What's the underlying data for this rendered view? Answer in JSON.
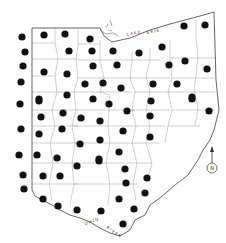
{
  "map": {
    "region": "Ohio",
    "description": "County outline map of Ohio with a dot marking each sampled county",
    "labels": {
      "lake": "LAKE ERIE",
      "lake_part1": "LAKE",
      "lake_part2": "ERIE",
      "river": "OHIO RIVER",
      "river_part1": "OHIO",
      "river_part2": "RIVER",
      "north": "N"
    },
    "colors": {
      "background": "#ffffff",
      "border": "#555555",
      "county_line": "#9a9a9a",
      "dot": "#111111"
    },
    "dots": [
      [
        22,
        37
      ],
      [
        44,
        35
      ],
      [
        65,
        34
      ],
      [
        90,
        39
      ],
      [
        184,
        26
      ],
      [
        205,
        25
      ],
      [
        25,
        52
      ],
      [
        69,
        51
      ],
      [
        92,
        51
      ],
      [
        113,
        51
      ],
      [
        139,
        53
      ],
      [
        162,
        47
      ],
      [
        23,
        66
      ],
      [
        44,
        72
      ],
      [
        67,
        74
      ],
      [
        93,
        66
      ],
      [
        117,
        65
      ],
      [
        169,
        65
      ],
      [
        185,
        61
      ],
      [
        207,
        69
      ],
      [
        21,
        82
      ],
      [
        85,
        84
      ],
      [
        103,
        83
      ],
      [
        121,
        88
      ],
      [
        153,
        84
      ],
      [
        177,
        84
      ],
      [
        67,
        95
      ],
      [
        39,
        99
      ],
      [
        93,
        99
      ],
      [
        192,
        97
      ],
      [
        20,
        104
      ],
      [
        39,
        101
      ],
      [
        109,
        104
      ],
      [
        151,
        101
      ],
      [
        192,
        99
      ],
      [
        41,
        117
      ],
      [
        63,
        113
      ],
      [
        81,
        118
      ],
      [
        100,
        121
      ],
      [
        127,
        111
      ],
      [
        150,
        116
      ],
      [
        209,
        111
      ],
      [
        21,
        129
      ],
      [
        39,
        134
      ],
      [
        62,
        129
      ],
      [
        123,
        131
      ],
      [
        100,
        140
      ],
      [
        80,
        144
      ],
      [
        150,
        137
      ],
      [
        19,
        155
      ],
      [
        37,
        155
      ],
      [
        57,
        158
      ],
      [
        119,
        152
      ],
      [
        99,
        159
      ],
      [
        77,
        166
      ],
      [
        99,
        161
      ],
      [
        125,
        169
      ],
      [
        23,
        175
      ],
      [
        43,
        176
      ],
      [
        60,
        176
      ],
      [
        147,
        178
      ],
      [
        126,
        183
      ],
      [
        24,
        189
      ],
      [
        43,
        199
      ],
      [
        119,
        199
      ],
      [
        145,
        193
      ],
      [
        58,
        206
      ],
      [
        77,
        210
      ],
      [
        101,
        211
      ],
      [
        134,
        209
      ],
      [
        123,
        224
      ]
    ]
  }
}
